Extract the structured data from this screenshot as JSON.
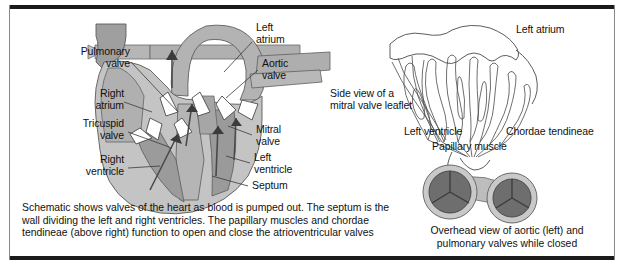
{
  "figure": {
    "colors": {
      "ink": "#111111",
      "frame": "#1b1b1b",
      "muscle_light": "#c9c9c9",
      "muscle_mid": "#a8a8a8",
      "muscle_dark": "#8e8e8e",
      "valve_disc": "#6e6e6e",
      "outline": "#4a4a4a",
      "background": "#ffffff"
    }
  },
  "left_panel": {
    "name": "heart-cross-section",
    "labels": [
      {
        "key": "pulmonary_valve",
        "text": "Pulmonary\nvalve"
      },
      {
        "key": "right_atrium",
        "text": "Right\natrium"
      },
      {
        "key": "tricuspid_valve",
        "text": "Tricuspid\nvalve"
      },
      {
        "key": "right_ventricle",
        "text": "Right\nventricle"
      },
      {
        "key": "left_atrium",
        "text": "Left\natrium"
      },
      {
        "key": "aortic_valve",
        "text": "Aortic\nvalve"
      },
      {
        "key": "mitral_valve",
        "text": "Mitral\nvalve"
      },
      {
        "key": "left_ventricle",
        "text": "Left\nventricle"
      },
      {
        "key": "septum",
        "text": "Septum"
      }
    ],
    "caption": "Schematic shows valves of the heart as blood is pumped out. The septum is the\nwall dividing the left and right ventricles. The papillary muscles and chordae\ntendineae (above right) function to open and close the atrioventricular valves"
  },
  "right_panel": {
    "name": "mitral-leaflet-and-valve-views",
    "leaflet_view": {
      "title": "Side view of a\nmitral valve leaflet",
      "labels": [
        {
          "key": "left_atrium",
          "text": "Left atrium"
        },
        {
          "key": "left_ventricle",
          "text": "Left ventricle"
        },
        {
          "key": "chordae_tendineae",
          "text": "Chordae tendineae"
        },
        {
          "key": "papillary_muscle",
          "text": "Papillary muscle"
        }
      ]
    },
    "valve_view": {
      "caption": "Overhead view of aortic (left) and\npulmonary valves while closed"
    }
  }
}
